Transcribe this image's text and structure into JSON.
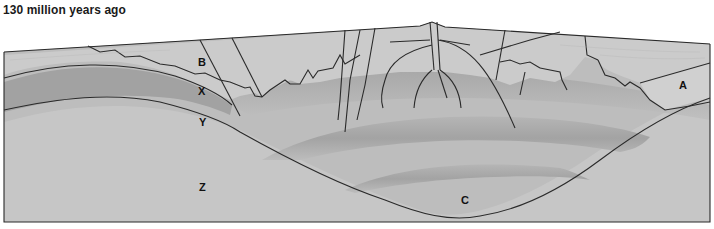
{
  "title": "130 million years ago",
  "diagram": {
    "type": "geologic cross-section",
    "labels": {
      "A": "A",
      "B": "B",
      "C": "C",
      "X": "X",
      "Y": "Y",
      "Z": "Z"
    },
    "colors": {
      "background": "#ffffff",
      "outline": "#2a2a2a",
      "surface_layer": "#c9c9c9",
      "layer_x": "#a9a9a9",
      "layer_y": "#bdbdbd",
      "layer_z": "#c4c4c4",
      "fold_band": "#a8a8a8"
    }
  }
}
